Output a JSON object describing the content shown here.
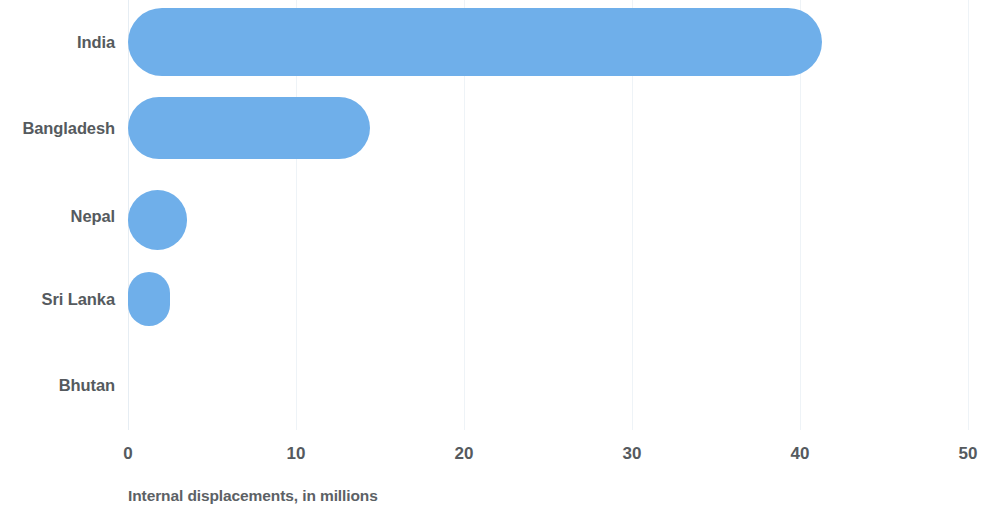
{
  "chart_data": {
    "type": "bar",
    "orientation": "horizontal",
    "title": "",
    "subtitle": "",
    "xlabel": "Internal displacements, in millions",
    "ylabel": "",
    "categories": [
      "India",
      "Bangladesh",
      "Nepal",
      "Sri Lanka",
      "Bhutan"
    ],
    "values": [
      41.3,
      14.4,
      3.5,
      2.5,
      0.05
    ],
    "series": [
      {
        "name": "Internal displacements",
        "values": [
          41.3,
          14.4,
          3.5,
          2.5,
          0.05
        ]
      }
    ],
    "xlim": [
      0,
      50
    ],
    "ylim": null,
    "xticks": [
      0,
      10,
      20,
      30,
      40,
      50
    ],
    "xtick_labels": [
      "0",
      "10",
      "20",
      "30",
      "40",
      "50"
    ],
    "grid": true,
    "grid_axis": "x",
    "legend": false,
    "legend_position": "none",
    "bar_color": "#6FAFEA",
    "text_color": "#555a5e",
    "background_color": "#ffffff",
    "bar_shape": "rounded-pill",
    "annotations": []
  },
  "axis": {
    "caption": "Internal displacements, in millions"
  }
}
